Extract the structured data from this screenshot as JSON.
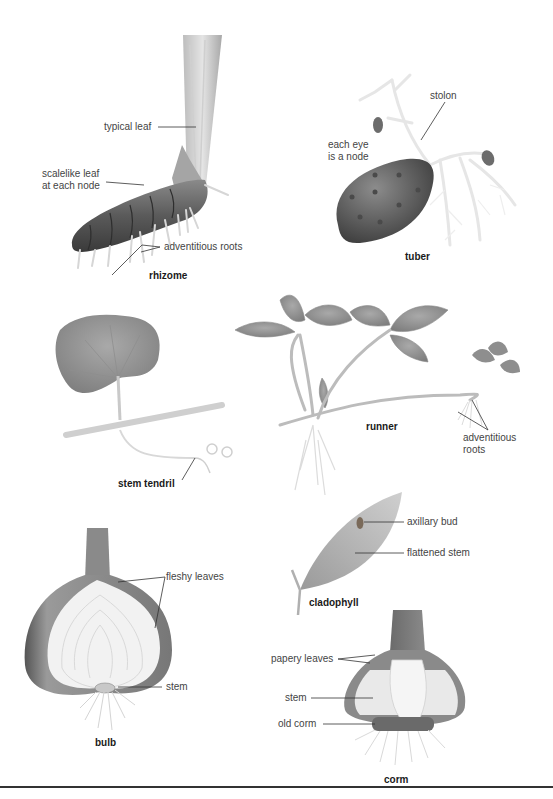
{
  "figure": {
    "panels": [
      {
        "id": "rhizome",
        "title": "rhizome",
        "labels": [
          "typical leaf",
          "scalelike leaf at each node",
          "adventitious roots"
        ]
      },
      {
        "id": "tuber",
        "title": "tuber",
        "labels": [
          "stolon",
          "each eye is a node"
        ]
      },
      {
        "id": "stem-tendril",
        "title": "stem tendril",
        "labels": []
      },
      {
        "id": "runner",
        "title": "runner",
        "labels": [
          "adventitious roots"
        ]
      },
      {
        "id": "cladophyll",
        "title": "cladophyll",
        "labels": [
          "axillary bud",
          "flattened stem"
        ]
      },
      {
        "id": "bulb",
        "title": "bulb",
        "labels": [
          "fleshy leaves",
          "stem"
        ]
      },
      {
        "id": "corm",
        "title": "corm",
        "labels": [
          "papery leaves",
          "stem",
          "old corm"
        ]
      }
    ]
  },
  "text": {
    "rhizome_title": "rhizome",
    "rhizome_typical_leaf": "typical leaf",
    "rhizome_scalelike_1": "scalelike leaf",
    "rhizome_scalelike_2": "at each node",
    "rhizome_roots": "adventitious roots",
    "tuber_title": "tuber",
    "tuber_stolon": "stolon",
    "tuber_eye_1": "each eye",
    "tuber_eye_2": "is a node",
    "tendril_title": "stem tendril",
    "runner_title": "runner",
    "runner_roots_1": "adventitious",
    "runner_roots_2": "roots",
    "clado_title": "cladophyll",
    "clado_bud": "axillary bud",
    "clado_flat": "flattened stem",
    "bulb_title": "bulb",
    "bulb_fleshy": "fleshy leaves",
    "bulb_stem": "stem",
    "corm_title": "corm",
    "corm_papery": "papery leaves",
    "corm_stem": "stem",
    "corm_old": "old corm"
  },
  "colors": {
    "background": "#ffffff",
    "label_text": "#444444",
    "title_text": "#1a1a1a",
    "leader_line": "#333333",
    "rule": "#333333"
  }
}
